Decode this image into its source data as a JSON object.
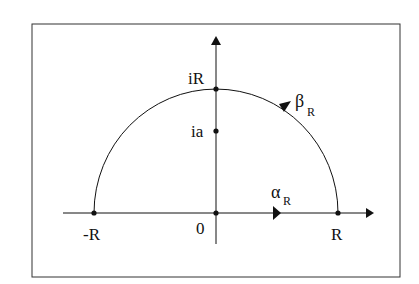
{
  "diagram": {
    "labels": {
      "neg_R": "-R",
      "origin": "0",
      "pos_R": "R",
      "iR": "iR",
      "ia": "ia",
      "alpha": "α",
      "alpha_sub": "R",
      "beta": "β",
      "beta_sub": "R"
    },
    "points": [
      {
        "name": "-R",
        "x": -1,
        "y": 0
      },
      {
        "name": "0",
        "x": 0,
        "y": 0
      },
      {
        "name": "R",
        "x": 1,
        "y": 0
      },
      {
        "name": "iR",
        "x": 0,
        "y": 1
      },
      {
        "name": "ia",
        "x": 0,
        "y": 0.65
      }
    ],
    "paths": [
      {
        "name": "alpha_R",
        "description": "segment from -R to R along real axis",
        "direction": "left-to-right"
      },
      {
        "name": "beta_R",
        "description": "upper semicircle from R to -R",
        "direction": "counterclockwise"
      }
    ],
    "colors": {
      "stroke": "#111111",
      "frame": "#333333",
      "background": "#ffffff"
    }
  }
}
